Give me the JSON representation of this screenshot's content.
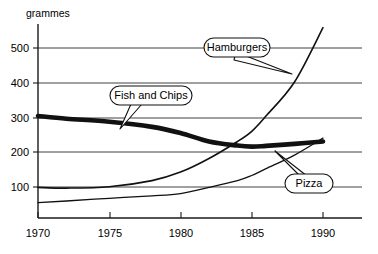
{
  "chart_data": {
    "type": "line",
    "title": "",
    "subtitle": "",
    "xlabel": "",
    "ylabel": "grammes",
    "x": [
      1970,
      1975,
      1980,
      1985,
      1990
    ],
    "xlim": [
      1970,
      1991
    ],
    "ylim": [
      0,
      600
    ],
    "xticks": [
      "1970",
      "1975",
      "1980",
      "1985",
      "1990"
    ],
    "yticks": [
      "100",
      "200",
      "300",
      "400",
      "500"
    ],
    "grid": "horizontal",
    "legend_position": "inline-callouts",
    "series": [
      {
        "name": "Fish and Chips",
        "style": "thick",
        "x": [
          1970,
          1972,
          1975,
          1978,
          1980,
          1982,
          1984,
          1985,
          1986,
          1988,
          1990
        ],
        "values": [
          300,
          292,
          283,
          268,
          250,
          225,
          213,
          210,
          212,
          218,
          225
        ]
      },
      {
        "name": "Hamburgers",
        "style": "thin",
        "x": [
          1970,
          1972,
          1975,
          1978,
          1980,
          1982,
          1984,
          1985,
          1986,
          1988,
          1990
        ],
        "values": [
          90,
          88,
          92,
          110,
          135,
          175,
          225,
          255,
          300,
          400,
          560
        ]
      },
      {
        "name": "Pizza",
        "style": "thin-light",
        "x": [
          1970,
          1972,
          1975,
          1978,
          1980,
          1982,
          1984,
          1985,
          1986,
          1988,
          1990
        ],
        "values": [
          45,
          50,
          58,
          65,
          72,
          90,
          110,
          125,
          145,
          185,
          235
        ]
      }
    ],
    "annotations": [
      {
        "text": "Hamburgers",
        "target_x": 1986,
        "target_y": 330
      },
      {
        "text": "Fish and Chips",
        "target_x": 1976,
        "target_y": 280
      },
      {
        "text": "Pizza",
        "target_x": 1986,
        "target_y": 150
      }
    ]
  },
  "axis": {
    "y_title": "grammes",
    "y_tick_500": "500",
    "y_tick_400": "400",
    "y_tick_300": "300",
    "y_tick_200": "200",
    "y_tick_100": "100",
    "x_tick_1970": "1970",
    "x_tick_1975": "1975",
    "x_tick_1980": "1980",
    "x_tick_1985": "1985",
    "x_tick_1990": "1990"
  },
  "callouts": {
    "hamburgers": "Hamburgers",
    "fish_and_chips": "Fish and Chips",
    "pizza": "Pizza"
  },
  "colors": {
    "ink": "#111111",
    "background": "#ffffff",
    "grid": "#2b2b2b"
  }
}
